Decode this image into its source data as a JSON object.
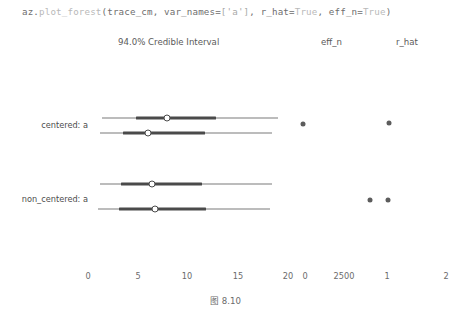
{
  "code": {
    "full": "az.plot_forest(trace_cm, var_names=['a'], r_hat=True, eff_n=True)",
    "seg_a": "az.",
    "seg_b": "plot_forest",
    "seg_c": "(trace_cm, var_names=",
    "seg_d": "['a']",
    "seg_e": ", r_hat=",
    "seg_f": "True",
    "seg_g": ", eff_n=",
    "seg_h": "True",
    "seg_i": ")"
  },
  "titles": {
    "credible_interval": "94.0% Credible Interval",
    "eff_n": "eff_n",
    "r_hat": "r_hat"
  },
  "caption": "图 8.10",
  "colors": {
    "line": "#7b7b7b",
    "line_dark": "#4a4a4a",
    "dot": "#5c5c5c",
    "text": "#6b6b6b",
    "background": "#ffffff"
  },
  "chart_data": {
    "type": "forest",
    "title": "94.0% Credible Interval",
    "xlabel": "",
    "ylabel": "",
    "grid": false,
    "legend": "none",
    "panels": [
      {
        "name": "credible-interval",
        "title": "94.0% Credible Interval",
        "xlim": [
          0,
          20
        ],
        "xticks": [
          0,
          5,
          10,
          15,
          20
        ],
        "xtick_labels": [
          "0",
          "5",
          "10",
          "15",
          "20"
        ]
      },
      {
        "name": "eff_n",
        "title": "eff_n",
        "xlim": [
          0,
          5000
        ],
        "xticks": [
          0,
          2500
        ],
        "xtick_labels": [
          "0",
          "2500"
        ]
      },
      {
        "name": "r_hat",
        "title": "r_hat",
        "xlim": [
          1,
          2
        ],
        "xticks": [
          1,
          2
        ],
        "xtick_labels": [
          "1",
          "2"
        ]
      }
    ],
    "variables": [
      {
        "label": "centered: a",
        "chains": [
          {
            "chain": 0,
            "hdi_94": [
              0.4,
              18.6
            ],
            "hdi_50": [
              4.8,
              12.4
            ],
            "point_estimate": 7.9
          },
          {
            "chain": 1,
            "hdi_94": [
              0.2,
              17.6
            ],
            "hdi_50": [
              3.1,
              11.0
            ],
            "point_estimate": 6.9
          }
        ],
        "eff_n": [
          300
        ],
        "r_hat": [
          1.02
        ]
      },
      {
        "label": "non_centered: a",
        "chains": [
          {
            "chain": 0,
            "hdi_94": [
              0.1,
              17.8
            ],
            "hdi_50": [
              3.6,
              13.4
            ],
            "point_estimate": 8.2
          },
          {
            "chain": 1,
            "hdi_94": [
              0.1,
              17.2
            ],
            "hdi_50": [
              3.3,
              12.6
            ],
            "point_estimate": 7.6
          }
        ],
        "eff_n": [
          2200,
          2700
        ],
        "r_hat": [
          1.0
        ]
      }
    ]
  },
  "axis_ticks_row": [
    {
      "label": "0",
      "x": 88
    },
    {
      "label": "5",
      "x": 138
    },
    {
      "label": "10",
      "x": 187
    },
    {
      "label": "15",
      "x": 238
    },
    {
      "label": "20",
      "x": 288
    },
    {
      "label": "0",
      "x": 305
    },
    {
      "label": "2500",
      "x": 344
    },
    {
      "label": "1",
      "x": 387
    },
    {
      "label": "2",
      "x": 446
    }
  ],
  "rows": [
    {
      "label": "centered: a",
      "label_x": 88,
      "label_y": 125,
      "lines": [
        {
          "y": 118,
          "outer": [
            102,
            278
          ],
          "inner": [
            136,
            216
          ],
          "point": 167
        },
        {
          "y": 133,
          "outer": [
            100,
            272
          ],
          "inner": [
            123,
            205
          ],
          "point": 148
        }
      ],
      "eff_n_dots": [
        {
          "x": 303,
          "y": 124
        }
      ],
      "r_hat_dots": [
        {
          "x": 389,
          "y": 123
        }
      ]
    },
    {
      "label": "non_centered: a",
      "label_x": 88,
      "label_y": 199,
      "lines": [
        {
          "y": 184,
          "outer": [
            100,
            272
          ],
          "inner": [
            121,
            202
          ],
          "point": 152
        },
        {
          "y": 209,
          "outer": [
            98,
            270
          ],
          "inner": [
            119,
            206
          ],
          "point": 155
        }
      ],
      "eff_n_dots": [
        {
          "x": 370,
          "y": 200
        },
        {
          "x": 388,
          "y": 200
        }
      ],
      "r_hat_dots": []
    }
  ]
}
